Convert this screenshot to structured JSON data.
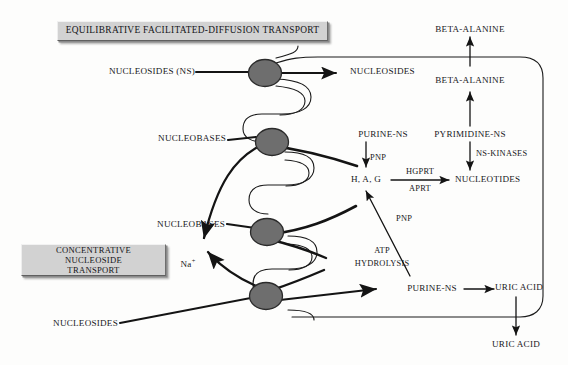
{
  "diagram": {
    "title_plates": [
      {
        "id": "equilibrative",
        "label": "EQUILIBRATIVE FACILITATED-DIFFUSION TRANSPORT"
      },
      {
        "id": "concentrative",
        "label": "CONCENTRATIVE NUCLEOSIDE\nTRANSPORT"
      }
    ],
    "extracellular_labels": [
      {
        "id": "nucleosides-ns-in",
        "text": "NUCLEOSIDES (NS)"
      },
      {
        "id": "nucleobases-upper",
        "text": "NUCLEOBASES"
      },
      {
        "id": "nucleobases-lower",
        "text": "NUCLEOBASES"
      },
      {
        "id": "nucleosides-lower",
        "text": "NUCLEOSIDES"
      },
      {
        "id": "sodium-ion",
        "text": "Na",
        "superscript": "+"
      },
      {
        "id": "beta-alanine-out",
        "text": "BETA-ALANINE"
      },
      {
        "id": "uric-acid-out",
        "text": "URIC ACID"
      }
    ],
    "intracellular_labels": [
      {
        "id": "nucleosides-cyto",
        "text": "NUCLEOSIDES"
      },
      {
        "id": "purine-ns-upper",
        "text": "PURINE-NS"
      },
      {
        "id": "bases-hag",
        "text": "H, A, G"
      },
      {
        "id": "nucleotides",
        "text": "NUCLEOTIDES"
      },
      {
        "id": "pyrimidine-ns",
        "text": "PYRIMIDINE-NS"
      },
      {
        "id": "beta-alanine-in",
        "text": "BETA-ALANINE"
      },
      {
        "id": "purine-ns-lower",
        "text": "PURINE-NS"
      },
      {
        "id": "uric-acid-in",
        "text": "URIC ACID"
      }
    ],
    "enzyme_labels": [
      {
        "id": "pnp-upper",
        "text": "PNP"
      },
      {
        "id": "pnp-lower",
        "text": "PNP"
      },
      {
        "id": "hgprt",
        "text": "HGPRT"
      },
      {
        "id": "aprt",
        "text": "APRT"
      },
      {
        "id": "ns-kinases",
        "text": "NS-KINASES"
      },
      {
        "id": "atp-hydrolysis-line1",
        "text": "ATP"
      },
      {
        "id": "atp-hydrolysis-line2",
        "text": "HYDROLYSIS"
      }
    ],
    "colors": {
      "transporter_fill": "#6e6e6e",
      "transporter_stroke": "#2b2b2b",
      "membrane_stroke": "#1a1a1a",
      "arrow_stroke": "#141414",
      "plate_fill": "#d2d2d2",
      "text": "#17171a",
      "background": "#fdfdfc"
    },
    "transporter_count": 4
  }
}
